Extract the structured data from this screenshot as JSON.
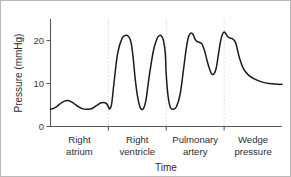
{
  "chart_data": {
    "type": "line",
    "title": "",
    "xlabel": "Time",
    "ylabel": "Pressure (mmHg)",
    "ylim": [
      0,
      25
    ],
    "yticks": [
      0,
      10,
      20
    ],
    "ytick_labels": [
      "0",
      "10",
      "20"
    ],
    "xlim": [
      0,
      100
    ],
    "grid": false,
    "legend": null,
    "annotations": [
      {
        "label": "Right atrium",
        "line1": "Right",
        "line2": "atrium",
        "x_range": [
          0,
          25
        ]
      },
      {
        "label": "Right ventricle",
        "line1": "Right",
        "line2": "ventricle",
        "x_range": [
          25,
          50
        ]
      },
      {
        "label": "Pulmonary artery",
        "line1": "Pulmonary",
        "line2": "artery",
        "x_range": [
          50,
          75
        ]
      },
      {
        "label": "Wedge pressure",
        "line1": "Wedge",
        "line2": "pressure",
        "x_range": [
          75,
          100
        ]
      }
    ],
    "phase_dividers": [
      25,
      50,
      75
    ],
    "series": [
      {
        "name": "Catheter pressure tracing",
        "color": "#1b1b1b",
        "x": [
          0,
          2,
          4,
          6,
          8,
          10,
          12,
          14,
          16,
          18,
          20,
          22,
          24,
          25,
          25.6,
          26.4,
          27.4,
          29,
          31,
          32.6,
          33.6,
          34.3,
          35,
          35.8,
          36.6,
          37.6,
          38.6,
          39.4,
          40.2,
          41.2,
          42.6,
          44.4,
          46,
          47.2,
          48,
          48.8,
          49.6,
          50,
          50.8,
          51.8,
          53,
          54.4,
          56,
          57.4,
          58.6,
          59.6,
          60.6,
          61.6,
          62.4,
          63.2,
          64.2,
          65.4,
          66.6,
          68,
          69.4,
          70.6,
          71.6,
          72.6,
          73.6,
          74.4,
          75,
          75.6,
          76.4,
          77.4,
          78.6,
          80,
          81.6,
          83.4,
          85.4,
          87.6,
          90,
          92.4,
          94.6,
          96.6,
          98.4,
          100
        ],
        "y": [
          4.0,
          4.4,
          5.2,
          5.9,
          6.0,
          5.4,
          4.6,
          4.1,
          4.0,
          4.2,
          4.9,
          5.5,
          5.4,
          4.6,
          4.1,
          5.2,
          10.0,
          17.0,
          20.6,
          21.2,
          21.0,
          20.4,
          19.0,
          15.5,
          11.0,
          7.0,
          4.6,
          4.0,
          4.2,
          6.0,
          11.5,
          17.5,
          20.4,
          21.2,
          21.0,
          20.0,
          17.0,
          12.0,
          7.0,
          4.4,
          4.0,
          4.6,
          7.5,
          13.0,
          18.0,
          20.8,
          21.7,
          21.4,
          20.4,
          19.8,
          19.6,
          19.2,
          17.5,
          14.6,
          12.4,
          12.2,
          13.6,
          17.0,
          20.2,
          21.6,
          22.0,
          21.7,
          21.0,
          20.6,
          20.4,
          19.4,
          16.0,
          13.4,
          12.0,
          11.2,
          10.6,
          10.2,
          10.0,
          9.9,
          9.8,
          9.8
        ],
        "values_summary": {
          "right_atrium_mean": 5,
          "right_ventricle_systolic": 21,
          "right_ventricle_diastolic": 4,
          "pulmonary_artery_systolic": 22,
          "pulmonary_artery_diastolic": 12,
          "wedge_pressure_mean": 10
        }
      }
    ]
  },
  "axes": {
    "y_title": "Pressure (mmHg)",
    "x_title": "Time",
    "y_tick_0": "0",
    "y_tick_10": "10",
    "y_tick_20": "20"
  },
  "segments": {
    "ra_line1": "Right",
    "ra_line2": "atrium",
    "rv_line1": "Right",
    "rv_line2": "ventricle",
    "pa_line1": "Pulmonary",
    "pa_line2": "artery",
    "wp_line1": "Wedge",
    "wp_line2": "pressure"
  },
  "colors": {
    "trace": "#1b1b1b",
    "axis": "#58585a",
    "divider": "#d6d6d6",
    "border": "#b9b9b9",
    "background": "#ffffff"
  }
}
